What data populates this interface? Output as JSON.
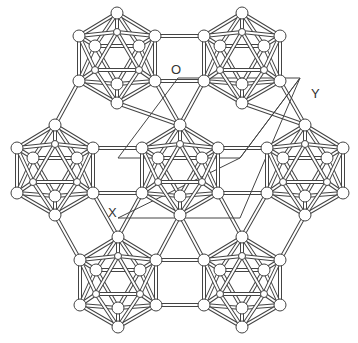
{
  "diagram": {
    "labels": [
      {
        "text": "O",
        "x": 171,
        "y": 62
      },
      {
        "text": "Y",
        "x": 311,
        "y": 86
      },
      {
        "text": "X",
        "x": 108,
        "y": 205
      }
    ],
    "icosahedra": [
      {
        "name": "top-left",
        "cx": 117,
        "cy": 58
      },
      {
        "name": "top-right",
        "cx": 242,
        "cy": 58
      },
      {
        "name": "middle-left",
        "cx": 55,
        "cy": 170
      },
      {
        "name": "middle-center",
        "cx": 180,
        "cy": 170
      },
      {
        "name": "middle-right",
        "cx": 305,
        "cy": 170
      },
      {
        "name": "bottom-left",
        "cx": 118,
        "cy": 282
      },
      {
        "name": "bottom-right",
        "cx": 242,
        "cy": 282
      }
    ],
    "unit_cell": [
      [
        178,
        70
      ],
      [
        298,
        70
      ],
      [
        238,
        158
      ],
      [
        118,
        158
      ]
    ],
    "unit_cell2": [
      [
        178,
        70
      ],
      [
        298,
        70
      ],
      [
        178,
        218
      ],
      [
        118,
        218
      ]
    ],
    "colors": {
      "stroke": "#444444",
      "fill": "#ffffff"
    }
  }
}
